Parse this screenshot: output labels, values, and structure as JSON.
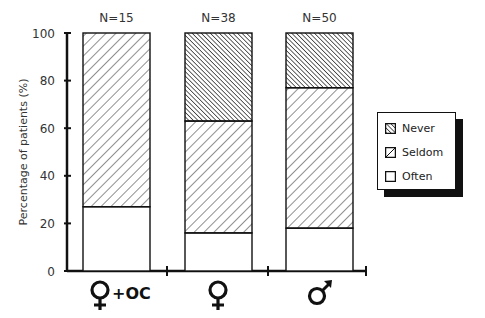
{
  "chart_data": {
    "type": "bar",
    "stacked": true,
    "title": "",
    "xlabel": "",
    "ylabel": "Percentage of patients (%)",
    "ylim": [
      0,
      100
    ],
    "yticks": [
      0,
      20,
      40,
      60,
      80,
      100
    ],
    "grid": false,
    "legend_position": "right",
    "categories": [
      "♀+OC",
      "♀",
      "♂"
    ],
    "category_counts": [
      "N=15",
      "N=38",
      "N=50"
    ],
    "series": [
      {
        "name": "Often",
        "pattern": "blank",
        "values": [
          27,
          16,
          18
        ]
      },
      {
        "name": "Seldom",
        "pattern": "sparse-hatch",
        "values": [
          73,
          47,
          59
        ]
      },
      {
        "name": "Never",
        "pattern": "dense-hatch",
        "values": [
          0,
          37,
          23
        ]
      }
    ],
    "legend": [
      "Never",
      "Seldom",
      "Often"
    ]
  },
  "colors": {
    "ink": "#111111",
    "background": "#ffffff"
  }
}
